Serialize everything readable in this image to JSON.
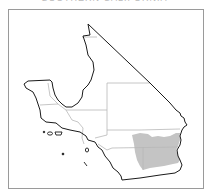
{
  "map": {
    "title": "SOUTHERN CALIFORNIA",
    "region": "Southern California counties",
    "shaded_region_color": "#c4c4c4",
    "outline_color": "#1a1a1a",
    "county_line_color": "#b5b5b5",
    "frame_color": "#9a9a9a"
  }
}
